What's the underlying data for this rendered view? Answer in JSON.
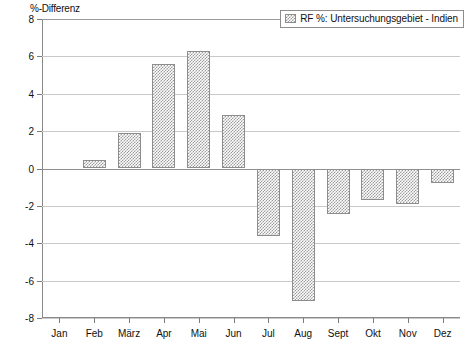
{
  "chart_data": {
    "type": "bar",
    "title": "",
    "subtitle": "",
    "xlabel": "",
    "ylabel": "%-Differenz",
    "ylim": [
      -8,
      8
    ],
    "yticks": [
      8,
      6,
      4,
      2,
      0,
      -2,
      -4,
      -6,
      -8
    ],
    "ytick_labels": [
      "8",
      "6",
      "4",
      "2",
      "0",
      "-2",
      "-4",
      "-6",
      "-8"
    ],
    "grid": true,
    "grid_axis": "y",
    "legend_position": "top-right",
    "categories": [
      "Jan",
      "Feb",
      "März",
      "Apr",
      "Mai",
      "Jun",
      "Jul",
      "Aug",
      "Sept",
      "Okt",
      "Nov",
      "Dez"
    ],
    "series": [
      {
        "name": "RF %: Untersuchungsgebiet - Indien",
        "values": [
          0,
          0.45,
          1.9,
          5.6,
          6.3,
          2.85,
          -3.6,
          -7.1,
          -2.45,
          -1.7,
          -1.9,
          -0.8
        ],
        "fill": "#9b9b9b",
        "pattern": "checker-dither",
        "edge_color": "#8d8d8d"
      }
    ]
  },
  "axes": {
    "y_title": "%-Differenz",
    "zero_line_value": 0
  },
  "legend": {
    "entries": [
      {
        "label": "RF %: Untersuchungsgebiet - Indien",
        "swatch_name": "legend-swatch-rf-indien"
      }
    ]
  },
  "colors": {
    "bar_fill": "#9b9b9b",
    "bar_edge": "#8d8d8d",
    "gridline": "#c9c9c9",
    "axis": "#8a8a8a",
    "text": "#111111",
    "background": "#ffffff"
  }
}
